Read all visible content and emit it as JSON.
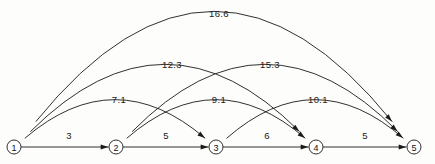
{
  "diagram": {
    "type": "directed-graph",
    "title": "",
    "nodes": [
      {
        "id": "1",
        "label": "1",
        "x": 14,
        "y": 147,
        "r": 7
      },
      {
        "id": "2",
        "label": "2",
        "x": 116,
        "y": 147,
        "r": 7
      },
      {
        "id": "3",
        "label": "3",
        "x": 216,
        "y": 147,
        "r": 7
      },
      {
        "id": "4",
        "label": "4",
        "x": 316,
        "y": 147,
        "r": 7
      },
      {
        "id": "5",
        "label": "5",
        "x": 414,
        "y": 147,
        "r": 7
      }
    ],
    "edges": [
      {
        "id": "e-1-2",
        "from": "1",
        "to": "2",
        "weight": "3",
        "shape": "straight",
        "label_x": 69,
        "label_y": 135
      },
      {
        "id": "e-2-3",
        "from": "2",
        "to": "3",
        "weight": "5",
        "shape": "straight",
        "label_x": 166,
        "label_y": 135
      },
      {
        "id": "e-3-4",
        "from": "3",
        "to": "4",
        "weight": "6",
        "shape": "straight",
        "label_x": 267,
        "label_y": 135
      },
      {
        "id": "e-4-5",
        "from": "4",
        "to": "5",
        "weight": "5",
        "shape": "straight",
        "label_x": 365,
        "label_y": 135
      },
      {
        "id": "e-1-3",
        "from": "1",
        "to": "3",
        "weight": "7.1",
        "shape": "arc",
        "apex_y": 104,
        "label_x": 119,
        "label_y": 99
      },
      {
        "id": "e-2-4",
        "from": "2",
        "to": "4",
        "weight": "9.1",
        "shape": "arc",
        "apex_y": 104,
        "label_x": 219,
        "label_y": 99
      },
      {
        "id": "e-3-5",
        "from": "3",
        "to": "5",
        "weight": "10.1",
        "shape": "arc",
        "apex_y": 104,
        "label_x": 318,
        "label_y": 99
      },
      {
        "id": "e-1-4",
        "from": "1",
        "to": "4",
        "weight": "12.3",
        "shape": "arc",
        "apex_y": 72,
        "label_x": 172,
        "label_y": 64
      },
      {
        "id": "e-2-5",
        "from": "2",
        "to": "5",
        "weight": "15.3",
        "shape": "arc",
        "apex_y": 72,
        "label_x": 270,
        "label_y": 64
      },
      {
        "id": "e-1-5",
        "from": "1",
        "to": "5",
        "weight": "16.6",
        "shape": "arc",
        "apex_y": 24,
        "label_x": 219,
        "label_y": 13
      }
    ],
    "colors": {
      "stroke": "#1a1a1a",
      "node_fill": "#ffffff",
      "background": "#fdfdfb",
      "text": "#1a1a1a"
    }
  }
}
